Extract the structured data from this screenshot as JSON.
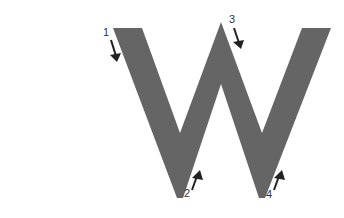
{
  "diagram": {
    "letter": "W",
    "stroke_fill_color": "#656565",
    "arrow_color": "#222222",
    "background_color": "#ffffff",
    "steps": [
      {
        "number": "1",
        "direction": "down",
        "x": 103,
        "y": 27
      },
      {
        "number": "2",
        "direction": "up",
        "x": 184,
        "y": 188
      },
      {
        "number": "3",
        "direction": "down",
        "x": 229,
        "y": 14
      },
      {
        "number": "4",
        "direction": "up",
        "x": 266,
        "y": 189
      }
    ]
  }
}
